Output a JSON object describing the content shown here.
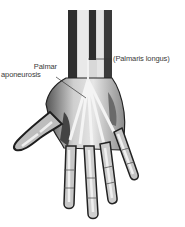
{
  "figure": {
    "labels": {
      "palmar_line1": "Palmar",
      "palmar_line2": "aponeurosis",
      "palmaris_longus": "(Palmaris longus)"
    }
  },
  "colors": {
    "background": "#ffffff",
    "dark_tone": "#2b2b2b",
    "mid_tone": "#7a7a7a",
    "light_tone": "#d9d9d9",
    "label_text": "#3a3a3a"
  }
}
